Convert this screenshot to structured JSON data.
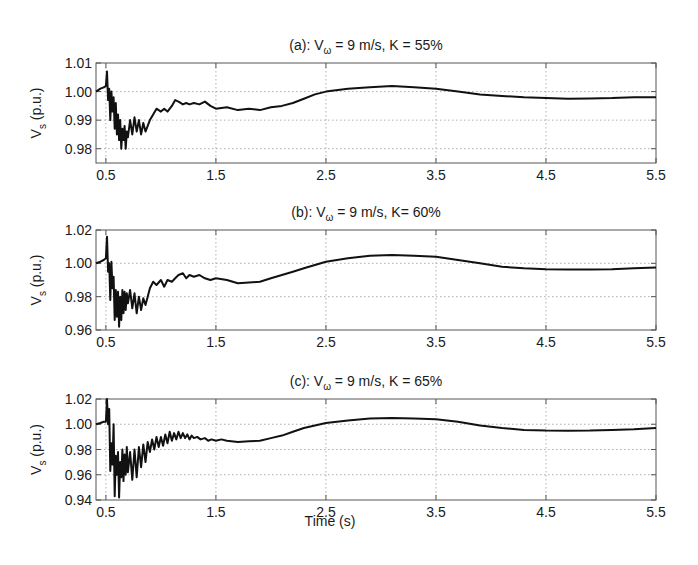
{
  "figure": {
    "xlabel": "Time (s)",
    "ylabel_main": "V",
    "ylabel_sub": "s",
    "ylabel_unit": " (p.u.)"
  },
  "chart_data": [
    {
      "type": "line",
      "title": "(a): Vω = 9 m/s, K = 55%",
      "title_parts": {
        "prefix": "(a): V",
        "sub": "ω",
        "suffix": " = 9 m/s, K = 55%"
      },
      "xlabel": "",
      "ylabel": "Vs (p.u.)",
      "xlim": [
        0.41,
        5.5
      ],
      "ylim": [
        0.975,
        1.01
      ],
      "xticks": [
        0.5,
        1.5,
        2.5,
        3.5,
        4.5,
        5.5
      ],
      "xtick_labels": [
        "0.5",
        "1.5",
        "2.5",
        "3.5",
        "4.5",
        "5.5"
      ],
      "yticks": [
        0.98,
        0.99,
        1.0,
        1.01
      ],
      "ytick_labels": [
        "0.98",
        "0.99",
        "1.00",
        "1.01"
      ],
      "grid": true,
      "series": [
        {
          "name": "Vs",
          "color": "#111111",
          "x": [
            0.41,
            0.45,
            0.48,
            0.5,
            0.51,
            0.52,
            0.53,
            0.54,
            0.55,
            0.56,
            0.57,
            0.58,
            0.59,
            0.6,
            0.61,
            0.62,
            0.63,
            0.64,
            0.65,
            0.66,
            0.67,
            0.68,
            0.69,
            0.7,
            0.72,
            0.74,
            0.76,
            0.78,
            0.8,
            0.82,
            0.84,
            0.86,
            0.88,
            0.9,
            0.93,
            0.96,
            1.0,
            1.03,
            1.06,
            1.1,
            1.13,
            1.16,
            1.2,
            1.23,
            1.26,
            1.3,
            1.35,
            1.4,
            1.45,
            1.5,
            1.6,
            1.7,
            1.8,
            1.9,
            2.0,
            2.1,
            2.2,
            2.3,
            2.4,
            2.5,
            2.7,
            2.9,
            3.1,
            3.3,
            3.5,
            3.7,
            3.9,
            4.1,
            4.3,
            4.5,
            4.7,
            4.9,
            5.1,
            5.3,
            5.5
          ],
          "y": [
            1.0,
            1.001,
            1.0015,
            1.002,
            1.007,
            0.997,
            1.001,
            0.99,
            1.0,
            0.993,
            0.998,
            0.987,
            0.996,
            0.985,
            0.992,
            0.983,
            0.99,
            0.98,
            0.987,
            0.983,
            0.988,
            0.98,
            0.986,
            0.984,
            0.99,
            0.985,
            0.991,
            0.986,
            0.99,
            0.985,
            0.989,
            0.986,
            0.988,
            0.99,
            0.992,
            0.994,
            0.993,
            0.994,
            0.993,
            0.995,
            0.997,
            0.9965,
            0.9955,
            0.996,
            0.9955,
            0.996,
            0.9955,
            0.9965,
            0.995,
            0.994,
            0.9945,
            0.9935,
            0.994,
            0.9935,
            0.9945,
            0.995,
            0.996,
            0.9975,
            0.999,
            1.0,
            1.001,
            1.0015,
            1.002,
            1.0015,
            1.001,
            1.0,
            0.999,
            0.9985,
            0.998,
            0.9977,
            0.9975,
            0.9976,
            0.9977,
            0.998,
            0.998
          ]
        }
      ]
    },
    {
      "type": "line",
      "title": "(b): Vω = 9 m/s, K= 60%",
      "title_parts": {
        "prefix": "(b): V",
        "sub": "ω",
        "suffix": " = 9 m/s, K= 60%"
      },
      "xlabel": "",
      "ylabel": "Vs (p.u.)",
      "xlim": [
        0.41,
        5.5
      ],
      "ylim": [
        0.96,
        1.02
      ],
      "xticks": [
        0.5,
        1.5,
        2.5,
        3.5,
        4.5,
        5.5
      ],
      "xtick_labels": [
        "0.5",
        "1.5",
        "2.5",
        "3.5",
        "4.5",
        "5.5"
      ],
      "yticks": [
        0.96,
        0.98,
        1.0,
        1.02
      ],
      "ytick_labels": [
        "0.96",
        "0.98",
        "1.00",
        "1.02"
      ],
      "grid": true,
      "series": [
        {
          "name": "Vs",
          "color": "#111111",
          "x": [
            0.41,
            0.45,
            0.48,
            0.5,
            0.51,
            0.52,
            0.53,
            0.54,
            0.55,
            0.56,
            0.57,
            0.58,
            0.59,
            0.6,
            0.61,
            0.62,
            0.63,
            0.64,
            0.65,
            0.66,
            0.67,
            0.68,
            0.69,
            0.7,
            0.72,
            0.74,
            0.76,
            0.78,
            0.8,
            0.82,
            0.84,
            0.86,
            0.88,
            0.9,
            0.93,
            0.96,
            1.0,
            1.03,
            1.06,
            1.1,
            1.13,
            1.16,
            1.2,
            1.23,
            1.26,
            1.3,
            1.35,
            1.4,
            1.45,
            1.5,
            1.6,
            1.7,
            1.8,
            1.9,
            2.0,
            2.1,
            2.2,
            2.3,
            2.4,
            2.5,
            2.7,
            2.9,
            3.1,
            3.3,
            3.5,
            3.7,
            3.9,
            4.1,
            4.3,
            4.5,
            4.7,
            4.9,
            5.1,
            5.3,
            5.5
          ],
          "y": [
            1.0,
            1.001,
            1.002,
            1.003,
            1.016,
            0.995,
            1.0,
            0.978,
            1.001,
            0.985,
            0.992,
            0.966,
            0.984,
            0.968,
            0.983,
            0.962,
            0.98,
            0.966,
            0.984,
            0.97,
            0.983,
            0.972,
            0.982,
            0.976,
            0.984,
            0.973,
            0.982,
            0.97,
            0.98,
            0.972,
            0.979,
            0.975,
            0.98,
            0.985,
            0.989,
            0.987,
            0.99,
            0.986,
            0.99,
            0.989,
            0.991,
            0.993,
            0.994,
            0.991,
            0.993,
            0.992,
            0.993,
            0.991,
            0.99,
            0.991,
            0.99,
            0.988,
            0.9885,
            0.989,
            0.991,
            0.993,
            0.995,
            0.997,
            0.999,
            1.001,
            1.003,
            1.0045,
            1.005,
            1.0045,
            1.004,
            1.002,
            1.0,
            0.998,
            0.997,
            0.9965,
            0.9963,
            0.9963,
            0.9965,
            0.997,
            0.9975
          ]
        }
      ]
    },
    {
      "type": "line",
      "title": "(c): Vω = 9 m/s, K = 65%",
      "title_parts": {
        "prefix": "(c): V",
        "sub": "ω",
        "suffix": " = 9 m/s, K = 65%"
      },
      "xlabel": "Time (s)",
      "ylabel": "Vs (p.u.)",
      "xlim": [
        0.41,
        5.5
      ],
      "ylim": [
        0.94,
        1.02
      ],
      "xticks": [
        0.5,
        1.5,
        2.5,
        3.5,
        4.5,
        5.5
      ],
      "xtick_labels": [
        "0.5",
        "1.5",
        "2.5",
        "3.5",
        "4.5",
        "5.5"
      ],
      "yticks": [
        0.94,
        0.96,
        0.98,
        1.0,
        1.02
      ],
      "ytick_labels": [
        "0.94",
        "0.96",
        "0.98",
        "1.00",
        "1.02"
      ],
      "grid": true,
      "series": [
        {
          "name": "Vs",
          "color": "#111111",
          "x": [
            0.41,
            0.45,
            0.48,
            0.5,
            0.51,
            0.52,
            0.53,
            0.54,
            0.55,
            0.56,
            0.57,
            0.58,
            0.59,
            0.6,
            0.61,
            0.62,
            0.63,
            0.64,
            0.65,
            0.66,
            0.67,
            0.68,
            0.69,
            0.7,
            0.72,
            0.74,
            0.76,
            0.78,
            0.8,
            0.82,
            0.84,
            0.86,
            0.88,
            0.9,
            0.92,
            0.94,
            0.96,
            0.98,
            1.0,
            1.02,
            1.04,
            1.06,
            1.08,
            1.1,
            1.12,
            1.14,
            1.16,
            1.18,
            1.2,
            1.22,
            1.24,
            1.26,
            1.28,
            1.3,
            1.33,
            1.36,
            1.4,
            1.43,
            1.46,
            1.5,
            1.55,
            1.6,
            1.7,
            1.8,
            1.9,
            2.0,
            2.1,
            2.2,
            2.3,
            2.4,
            2.5,
            2.7,
            2.9,
            3.1,
            3.3,
            3.5,
            3.7,
            3.9,
            4.1,
            4.3,
            4.5,
            4.7,
            4.9,
            5.1,
            5.3,
            5.5
          ],
          "y": [
            1.0,
            1.001,
            1.002,
            1.002,
            1.02,
            1.0,
            1.012,
            0.963,
            0.985,
            0.968,
            1.0,
            0.943,
            0.975,
            0.96,
            0.978,
            0.942,
            0.97,
            0.958,
            0.98,
            0.955,
            0.976,
            0.96,
            0.982,
            0.962,
            0.978,
            0.956,
            0.98,
            0.958,
            0.982,
            0.966,
            0.984,
            0.97,
            0.986,
            0.978,
            0.988,
            0.98,
            0.99,
            0.982,
            0.99,
            0.983,
            0.992,
            0.985,
            0.994,
            0.987,
            0.993,
            0.988,
            0.994,
            0.989,
            0.993,
            0.989,
            0.992,
            0.988,
            0.991,
            0.989,
            0.99,
            0.988,
            0.989,
            0.987,
            0.988,
            0.987,
            0.988,
            0.987,
            0.986,
            0.9865,
            0.987,
            0.989,
            0.991,
            0.994,
            0.997,
            0.999,
            1.001,
            1.003,
            1.0045,
            1.005,
            1.0045,
            1.004,
            1.002,
            0.999,
            0.997,
            0.9955,
            0.995,
            0.9948,
            0.995,
            0.9955,
            0.996,
            0.997
          ]
        }
      ]
    }
  ]
}
